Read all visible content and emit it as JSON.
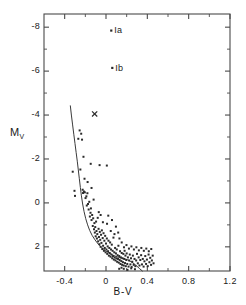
{
  "chart_data": {
    "type": "scatter",
    "title": "",
    "xlabel": "B-V",
    "ylabel": "M_V",
    "ylabel_base": "M",
    "ylabel_sub": "V",
    "xlim": [
      -0.6,
      1.2
    ],
    "ylim": [
      -8.6,
      3.1
    ],
    "y_inverted": true,
    "grid": false,
    "legend": "none",
    "xticks": [
      -0.4,
      0,
      0.4,
      0.8,
      1.2
    ],
    "xtick_labels": [
      "-0.4",
      "0",
      "0.4",
      "0.8",
      "1.2"
    ],
    "xminor_step": 0.2,
    "yticks": [
      -8,
      -6,
      -4,
      -2,
      0,
      2
    ],
    "ytick_labels": [
      "-8",
      "-6",
      "-4",
      "-2",
      "0",
      "2"
    ],
    "yminor_step": 1,
    "annotations": [
      {
        "label": "Ia",
        "x": 0.05,
        "y": -7.85,
        "marker": "point",
        "label_dx": 0.035,
        "label_dy": 0.12
      },
      {
        "label": "Ib",
        "x": 0.06,
        "y": -6.15,
        "marker": "point",
        "label_dx": 0.04,
        "label_dy": 0.12
      }
    ],
    "special_markers": [
      {
        "label": "x",
        "type": "cross",
        "x": -0.11,
        "y": -4.05
      }
    ],
    "curve": {
      "name": "zero-age-main-sequence",
      "points": [
        [
          -0.345,
          -4.42
        ],
        [
          -0.335,
          -4.0
        ],
        [
          -0.323,
          -3.55
        ],
        [
          -0.311,
          -3.1
        ],
        [
          -0.3,
          -2.7
        ],
        [
          -0.289,
          -2.3
        ],
        [
          -0.278,
          -1.9
        ],
        [
          -0.268,
          -1.5
        ],
        [
          -0.258,
          -1.1
        ],
        [
          -0.248,
          -0.7
        ],
        [
          -0.238,
          -0.32
        ],
        [
          -0.226,
          0.05
        ],
        [
          -0.212,
          0.4
        ],
        [
          -0.196,
          0.72
        ],
        [
          -0.178,
          1.0
        ],
        [
          -0.158,
          1.25
        ],
        [
          -0.134,
          1.48
        ],
        [
          -0.107,
          1.68
        ],
        [
          -0.076,
          1.87
        ],
        [
          -0.042,
          2.03
        ],
        [
          -0.005,
          2.17
        ],
        [
          0.035,
          2.3
        ],
        [
          0.078,
          2.4
        ],
        [
          0.122,
          2.48
        ],
        [
          0.165,
          2.53
        ],
        [
          0.205,
          2.58
        ],
        [
          0.245,
          2.68
        ],
        [
          0.285,
          2.82
        ],
        [
          0.322,
          2.98
        ],
        [
          0.352,
          3.1
        ]
      ]
    },
    "series": [
      {
        "name": "cluster-stars",
        "marker": "point",
        "points": [
          [
            -0.322,
            -1.42
          ],
          [
            -0.305,
            -0.55
          ],
          [
            -0.3,
            -0.32
          ],
          [
            -0.268,
            -2.92
          ],
          [
            -0.255,
            -3.3
          ],
          [
            -0.248,
            -1.52
          ],
          [
            -0.24,
            -3.15
          ],
          [
            -0.232,
            -2.88
          ],
          [
            -0.226,
            -0.6
          ],
          [
            -0.222,
            -0.45
          ],
          [
            -0.218,
            -2.1
          ],
          [
            -0.214,
            -0.52
          ],
          [
            -0.205,
            -0.48
          ],
          [
            -0.198,
            -0.22
          ],
          [
            -0.19,
            -0.3
          ],
          [
            -0.186,
            0.12
          ],
          [
            -0.18,
            -0.44
          ],
          [
            -0.174,
            0.05
          ],
          [
            -0.168,
            0.3
          ],
          [
            -0.162,
            -0.05
          ],
          [
            -0.156,
            0.62
          ],
          [
            -0.15,
            0.45
          ],
          [
            -0.146,
            0.25
          ],
          [
            -0.14,
            0.78
          ],
          [
            -0.134,
            0.55
          ],
          [
            -0.128,
            1.05
          ],
          [
            -0.124,
            0.7
          ],
          [
            -0.12,
            -0.15
          ],
          [
            -0.116,
            1.2
          ],
          [
            -0.112,
            0.92
          ],
          [
            -0.108,
            1.35
          ],
          [
            -0.104,
            1.1
          ],
          [
            -0.1,
            1.52
          ],
          [
            -0.096,
            0.85
          ],
          [
            -0.092,
            1.28
          ],
          [
            -0.088,
            1.62
          ],
          [
            -0.084,
            1.42
          ],
          [
            -0.08,
            0.68
          ],
          [
            -0.076,
            1.75
          ],
          [
            -0.072,
            1.18
          ],
          [
            -0.068,
            1.55
          ],
          [
            -0.064,
            1.88
          ],
          [
            -0.06,
            1.32
          ],
          [
            -0.056,
            1.68
          ],
          [
            -0.052,
            2.0
          ],
          [
            -0.048,
            1.45
          ],
          [
            -0.044,
            1.82
          ],
          [
            -0.04,
            1.25
          ],
          [
            -0.036,
            2.1
          ],
          [
            -0.032,
            1.6
          ],
          [
            -0.028,
            1.95
          ],
          [
            -0.024,
            1.38
          ],
          [
            -0.02,
            2.18
          ],
          [
            -0.016,
            1.72
          ],
          [
            -0.012,
            2.05
          ],
          [
            -0.008,
            1.5
          ],
          [
            -0.004,
            2.25
          ],
          [
            0.0,
            1.85
          ],
          [
            0.004,
            2.12
          ],
          [
            0.008,
            1.62
          ],
          [
            0.012,
            2.32
          ],
          [
            0.016,
            1.98
          ],
          [
            0.02,
            2.2
          ],
          [
            0.024,
            1.72
          ],
          [
            0.028,
            2.4
          ],
          [
            0.032,
            2.05
          ],
          [
            0.036,
            2.28
          ],
          [
            0.04,
            1.8
          ],
          [
            0.044,
            2.45
          ],
          [
            0.048,
            2.12
          ],
          [
            0.052,
            2.35
          ],
          [
            0.056,
            1.9
          ],
          [
            0.06,
            2.52
          ],
          [
            0.064,
            2.18
          ],
          [
            0.068,
            2.42
          ],
          [
            0.072,
            1.58
          ],
          [
            0.076,
            2.58
          ],
          [
            0.08,
            2.25
          ],
          [
            0.084,
            2.48
          ],
          [
            0.088,
            2.05
          ],
          [
            0.092,
            2.62
          ],
          [
            0.096,
            2.3
          ],
          [
            0.1,
            2.52
          ],
          [
            0.104,
            2.12
          ],
          [
            0.108,
            2.68
          ],
          [
            0.112,
            2.38
          ],
          [
            0.116,
            2.55
          ],
          [
            0.12,
            1.95
          ],
          [
            0.124,
            2.72
          ],
          [
            0.128,
            2.42
          ],
          [
            0.132,
            2.6
          ],
          [
            0.136,
            2.2
          ],
          [
            0.14,
            2.78
          ],
          [
            0.144,
            2.48
          ],
          [
            0.148,
            2.65
          ],
          [
            0.152,
            2.28
          ],
          [
            0.156,
            2.82
          ],
          [
            0.16,
            2.52
          ],
          [
            0.164,
            2.7
          ],
          [
            0.168,
            2.32
          ],
          [
            0.172,
            2.85
          ],
          [
            0.176,
            2.55
          ],
          [
            0.18,
            2.18
          ],
          [
            0.184,
            2.74
          ],
          [
            0.188,
            2.4
          ],
          [
            0.192,
            2.88
          ],
          [
            0.196,
            2.6
          ],
          [
            0.2,
            2.3
          ],
          [
            0.206,
            2.78
          ],
          [
            0.212,
            2.48
          ],
          [
            0.218,
            2.9
          ],
          [
            0.224,
            2.62
          ],
          [
            0.23,
            2.35
          ],
          [
            0.236,
            2.8
          ],
          [
            0.242,
            2.52
          ],
          [
            0.248,
            2.92
          ],
          [
            0.254,
            2.68
          ],
          [
            0.26,
            2.4
          ],
          [
            0.268,
            2.82
          ],
          [
            0.276,
            2.55
          ],
          [
            0.284,
            2.88
          ],
          [
            0.292,
            2.62
          ],
          [
            0.3,
            2.32
          ],
          [
            0.308,
            2.75
          ],
          [
            0.316,
            2.48
          ],
          [
            0.324,
            2.85
          ],
          [
            0.332,
            2.6
          ],
          [
            0.34,
            2.38
          ],
          [
            0.348,
            2.8
          ],
          [
            0.356,
            2.55
          ],
          [
            0.364,
            2.9
          ],
          [
            0.372,
            2.66
          ],
          [
            0.38,
            2.42
          ],
          [
            0.388,
            2.78
          ],
          [
            0.396,
            2.58
          ],
          [
            0.404,
            2.88
          ],
          [
            0.412,
            2.35
          ],
          [
            0.42,
            2.7
          ],
          [
            0.428,
            2.5
          ],
          [
            0.436,
            2.82
          ],
          [
            0.444,
            2.62
          ],
          [
            0.452,
            2.4
          ],
          [
            0.46,
            2.75
          ],
          [
            -0.07,
            0.42
          ],
          [
            -0.052,
            0.55
          ],
          [
            -0.03,
            0.88
          ],
          [
            0.01,
            0.95
          ],
          [
            0.046,
            1.28
          ],
          [
            0.082,
            1.42
          ],
          [
            0.118,
            1.35
          ],
          [
            0.058,
            0.78
          ],
          [
            0.13,
            1.62
          ],
          [
            0.152,
            1.8
          ],
          [
            0.096,
            1.08
          ],
          [
            0.022,
            0.58
          ],
          [
            -0.148,
            -1.78
          ],
          [
            -0.062,
            -1.72
          ],
          [
            0.008,
            -1.7
          ],
          [
            -0.208,
            -1.1
          ],
          [
            -0.178,
            -0.95
          ],
          [
            -0.14,
            -0.68
          ],
          [
            0.174,
            2.02
          ],
          [
            0.198,
            1.92
          ],
          [
            0.222,
            2.08
          ],
          [
            0.246,
            1.98
          ],
          [
            0.27,
            2.12
          ],
          [
            0.294,
            2.02
          ],
          [
            0.318,
            2.16
          ],
          [
            0.342,
            2.05
          ],
          [
            0.366,
            2.18
          ],
          [
            0.39,
            2.08
          ],
          [
            0.414,
            2.2
          ],
          [
            0.438,
            2.1
          ],
          [
            0.172,
            3.0
          ],
          [
            0.208,
            3.05
          ],
          [
            0.244,
            2.98
          ],
          [
            0.28,
            3.02
          ],
          [
            0.15,
            2.95
          ],
          [
            0.128,
            3.0
          ]
        ]
      }
    ]
  }
}
